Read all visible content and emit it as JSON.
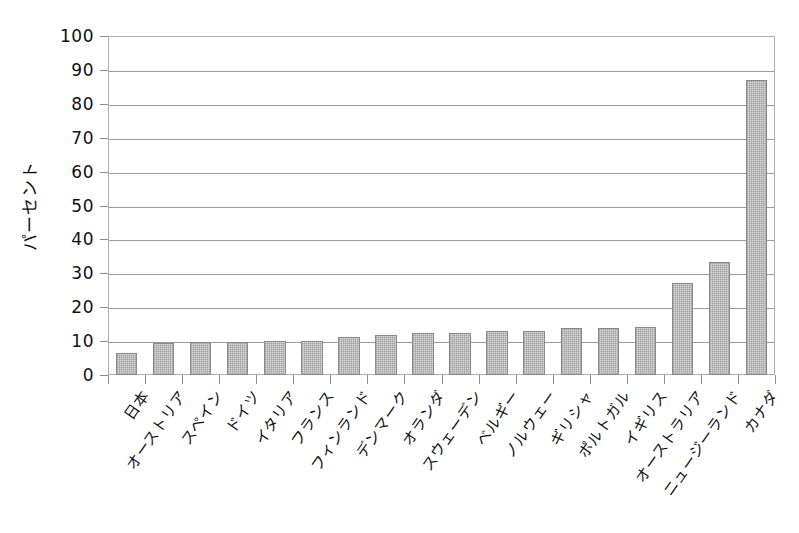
{
  "chart_data": {
    "type": "bar",
    "title": "",
    "subtitle": "",
    "xlabel": "",
    "ylabel": "パーセント",
    "ylim": [
      0,
      100
    ],
    "y_ticks": [
      0,
      10,
      20,
      30,
      40,
      50,
      60,
      70,
      80,
      90,
      100
    ],
    "grid": true,
    "legend": false,
    "legend_position": "none",
    "categories": [
      "日本",
      "オーストリア",
      "スペイン",
      "ドイツ",
      "イタリア",
      "フランス",
      "フィンランド",
      "デンマーク",
      "オランダ",
      "スウェーデン",
      "ベルギー",
      "ノルウェー",
      "ギリシャ",
      "ポルトガル",
      "イギリス",
      "オーストラリア",
      "ニュージーランド",
      "カナダ"
    ],
    "values": [
      6.5,
      9.3,
      9.7,
      9.8,
      9.9,
      10,
      11.3,
      11.8,
      12.3,
      12.5,
      12.9,
      13,
      14,
      14,
      14.3,
      27,
      33.3,
      87
    ],
    "series": [
      {
        "name": "パーセント",
        "values": [
          6.5,
          9.3,
          9.7,
          9.8,
          9.9,
          10,
          11.3,
          11.8,
          12.3,
          12.5,
          12.9,
          13,
          14,
          14,
          14.3,
          27,
          33.3,
          87
        ]
      }
    ],
    "colors": {
      "bar_fill": "#dcdcdc",
      "bar_border": "#8a8a8a",
      "gridline": "#9a9a9a",
      "frame": "#aeaeae",
      "background": "#ffffff",
      "text": "#111111"
    }
  }
}
